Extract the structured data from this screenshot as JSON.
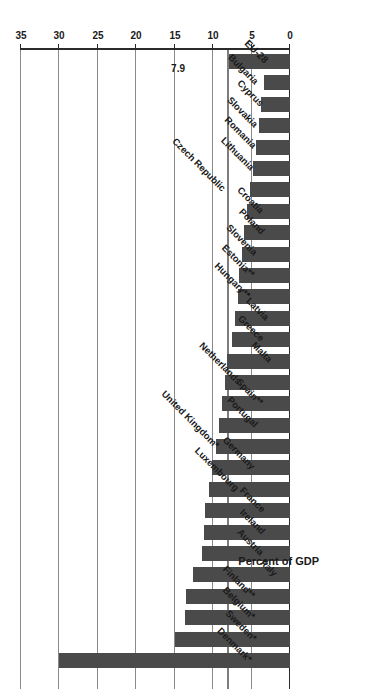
{
  "chart_data": {
    "type": "bar",
    "orientation": "horizontal",
    "title": "",
    "xlabel": "Percent of GDP",
    "ylabel": "",
    "xlim": [
      0,
      35
    ],
    "grid": true,
    "legend": false,
    "tick_labels": [
      "0",
      "5",
      "10",
      "15",
      "20",
      "25",
      "30",
      "35"
    ],
    "ticks": [
      0,
      5,
      10,
      15,
      20,
      25,
      30,
      35
    ],
    "reference_line": {
      "label": "7.9",
      "value": 7.9
    },
    "bar_color": "#4a4a4a",
    "categories": [
      "Denmark*",
      "Sweden*",
      "Belgium*",
      "Finland**",
      "Italy",
      "Austria",
      "Ireland",
      "France",
      "Luxembourg",
      "Germany",
      "United Kingdom*",
      "Portugal",
      "Spain**",
      "Netherlands",
      "Malta",
      "Greece",
      "Latvia",
      "Hungary**",
      "Estonia**",
      "Slovenia",
      "Poland",
      "Croatia",
      "Czech Republic",
      "Lithuania",
      "Romania",
      "Slovakia",
      "Cyprus",
      "Bulgaria",
      "EU-28"
    ],
    "values": [
      30.0,
      15.0,
      13.7,
      13.5,
      12.6,
      11.5,
      11.2,
      11.0,
      10.6,
      10.2,
      9.6,
      9.2,
      8.8,
      8.5,
      8.2,
      7.6,
      7.2,
      6.8,
      6.6,
      6.3,
      6.0,
      5.6,
      5.2,
      4.8,
      4.4,
      4.0,
      3.8,
      3.4,
      7.9
    ],
    "value_labels": {
      "EU-28": "7.9"
    }
  }
}
